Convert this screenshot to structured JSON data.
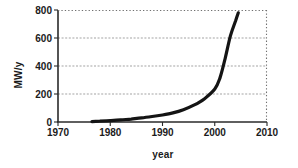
{
  "chart_data": {
    "type": "line",
    "title": "",
    "xlabel": "year",
    "ylabel": "MW/y",
    "xlim": [
      1970,
      2010
    ],
    "ylim": [
      0,
      800
    ],
    "x_ticks": [
      1970,
      1980,
      1990,
      2000,
      2010
    ],
    "y_ticks": [
      0,
      200,
      400,
      600,
      800
    ],
    "gridlines_y": [
      200,
      400,
      600
    ],
    "legend": "none",
    "grid": "horizontal gridlines; top and right frame borders dotted",
    "series": [
      {
        "name": "series-1",
        "x": [
          1976.5,
          1978,
          1980,
          1982,
          1984,
          1986,
          1988,
          1990,
          1992,
          1994,
          1996,
          1998,
          2000,
          2001,
          2002,
          2003,
          2004,
          2004.5
        ],
        "y": [
          3,
          6,
          10,
          15,
          21,
          29,
          39,
          50,
          65,
          88,
          120,
          165,
          235,
          315,
          455,
          615,
          725,
          780
        ]
      }
    ]
  },
  "styles": {
    "background": "#ffffff",
    "curve_color": "#141414",
    "axis_color": "#2a2a2a",
    "grid_color": "#999999",
    "frame_dotted_color": "#707070",
    "text_color": "#1b1b1b"
  }
}
